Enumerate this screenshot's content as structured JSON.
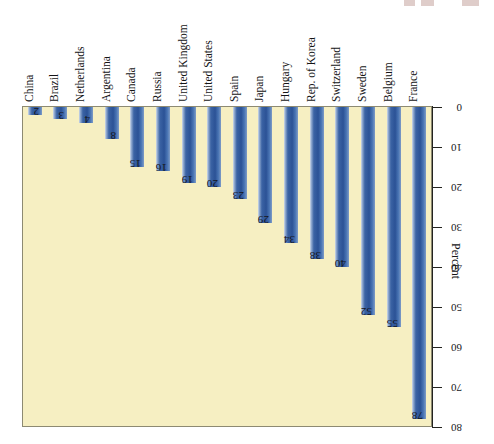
{
  "figure": {
    "axis_title": "Percent"
  },
  "chart_data": {
    "type": "bar",
    "title": "",
    "subtitle": "",
    "xlabel": "",
    "ylabel": "Percent",
    "ylim": [
      0,
      80
    ],
    "yticks": [
      0,
      10,
      20,
      30,
      40,
      50,
      60,
      70,
      80
    ],
    "grid": false,
    "legend": false,
    "orientation": "vertical-inverted",
    "categories": [
      "China",
      "Brazil",
      "Netherlands",
      "Argentina",
      "Canada",
      "Russia",
      "United Kingdom",
      "United States",
      "Spain",
      "Japan",
      "Hungary",
      "Rep. of Korea",
      "Switzerland",
      "Sweden",
      "Belgium",
      "France"
    ],
    "values": [
      2,
      3,
      4,
      8,
      15,
      16,
      19,
      20,
      23,
      29,
      34,
      38,
      40,
      52,
      55,
      78
    ],
    "value_labels": [
      "2",
      "3",
      "4",
      "8",
      "15",
      "16",
      "19",
      "20",
      "23",
      "29",
      "34",
      "38",
      "40",
      "52",
      "55",
      "78"
    ],
    "colors": {
      "bar": "#2b5296",
      "bar_highlight": "#9db4d6",
      "plot_background": "#f6efc2",
      "axis": "#23231f",
      "text": "#141416"
    }
  }
}
